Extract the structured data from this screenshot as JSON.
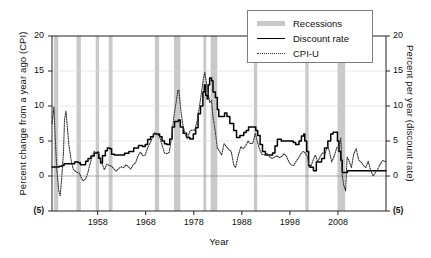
{
  "chart_data": {
    "type": "line",
    "title": "",
    "xlabel": "Year",
    "ylabel_left": "Percent change from a year ago (CPI)",
    "ylabel_right": "Percent per year (discount rate)",
    "xlim": [
      1948.5,
      2018
    ],
    "ylim": [
      -5,
      20
    ],
    "grid": true,
    "grid_values": [
      0,
      5,
      10,
      15,
      20
    ],
    "legend_position": "top-right",
    "xticks": [
      1958,
      1968,
      1978,
      1988,
      1998,
      2008
    ],
    "xtick_labels": [
      "1958",
      "1968",
      "1978",
      "1988",
      "1998",
      "2008"
    ],
    "yticks": [
      -5,
      0,
      5,
      10,
      15,
      20
    ],
    "ytick_labels": [
      "(5)",
      "0",
      "5",
      "10",
      "15",
      "20"
    ],
    "ytick_labels_right": [
      "(5)",
      "0",
      "5",
      "10",
      "15",
      "20"
    ],
    "legend": [
      {
        "name": "Recessions",
        "style": "band",
        "color": "#c8c8c8"
      },
      {
        "name": "Discount rate",
        "style": "solid",
        "color": "#000000"
      },
      {
        "name": "CPI-U",
        "style": "dotted",
        "color": "#333333"
      }
    ],
    "series": [
      {
        "name": "Discount rate",
        "style": "solid",
        "color": "#000000",
        "points": [
          [
            1948.5,
            1.3
          ],
          [
            1950.0,
            1.4
          ],
          [
            1950.6,
            1.5
          ],
          [
            1951.0,
            1.75
          ],
          [
            1952.5,
            1.75
          ],
          [
            1953.2,
            2.0
          ],
          [
            1954.0,
            1.9
          ],
          [
            1954.4,
            1.6
          ],
          [
            1955.0,
            1.6
          ],
          [
            1955.5,
            2.1
          ],
          [
            1956.0,
            2.5
          ],
          [
            1956.6,
            2.85
          ],
          [
            1957.3,
            3.3
          ],
          [
            1957.9,
            3.4
          ],
          [
            1958.2,
            2.55
          ],
          [
            1958.6,
            1.85
          ],
          [
            1959.0,
            2.9
          ],
          [
            1959.6,
            3.6
          ],
          [
            1960.0,
            4.0
          ],
          [
            1960.5,
            3.9
          ],
          [
            1960.9,
            3.1
          ],
          [
            1961.5,
            3.0
          ],
          [
            1963.0,
            3.0
          ],
          [
            1963.6,
            3.25
          ],
          [
            1964.5,
            3.5
          ],
          [
            1965.5,
            4.0
          ],
          [
            1966.5,
            4.35
          ],
          [
            1967.3,
            4.2
          ],
          [
            1967.9,
            4.5
          ],
          [
            1968.4,
            5.2
          ],
          [
            1969.0,
            5.6
          ],
          [
            1969.6,
            6.0
          ],
          [
            1970.3,
            6.0
          ],
          [
            1970.9,
            5.6
          ],
          [
            1971.4,
            5.0
          ],
          [
            1971.9,
            4.6
          ],
          [
            1972.4,
            4.5
          ],
          [
            1973.0,
            5.3
          ],
          [
            1973.5,
            7.0
          ],
          [
            1974.0,
            7.8
          ],
          [
            1974.8,
            8.0
          ],
          [
            1975.2,
            7.0
          ],
          [
            1975.8,
            6.1
          ],
          [
            1976.5,
            5.5
          ],
          [
            1977.2,
            5.3
          ],
          [
            1977.9,
            6.0
          ],
          [
            1978.4,
            6.9
          ],
          [
            1978.9,
            8.9
          ],
          [
            1979.4,
            10.0
          ],
          [
            1979.9,
            12.0
          ],
          [
            1980.2,
            13.0
          ],
          [
            1980.5,
            11.5
          ],
          [
            1980.8,
            11.0
          ],
          [
            1981.0,
            13.0
          ],
          [
            1981.3,
            14.0
          ],
          [
            1981.7,
            13.6
          ],
          [
            1982.0,
            12.0
          ],
          [
            1982.5,
            11.2
          ],
          [
            1982.9,
            9.5
          ],
          [
            1983.2,
            8.5
          ],
          [
            1983.8,
            8.5
          ],
          [
            1984.4,
            9.0
          ],
          [
            1984.9,
            8.5
          ],
          [
            1985.5,
            7.5
          ],
          [
            1986.3,
            6.5
          ],
          [
            1986.9,
            5.5
          ],
          [
            1987.6,
            5.8
          ],
          [
            1988.4,
            6.2
          ],
          [
            1988.9,
            6.5
          ],
          [
            1989.4,
            7.0
          ],
          [
            1990.4,
            7.0
          ],
          [
            1990.9,
            6.5
          ],
          [
            1991.3,
            5.8
          ],
          [
            1991.8,
            4.5
          ],
          [
            1992.3,
            3.5
          ],
          [
            1992.9,
            3.0
          ],
          [
            1993.9,
            3.0
          ],
          [
            1994.4,
            3.3
          ],
          [
            1994.9,
            4.3
          ],
          [
            1995.4,
            5.25
          ],
          [
            1996.2,
            5.0
          ],
          [
            1997.5,
            5.0
          ],
          [
            1998.7,
            4.8
          ],
          [
            1999.2,
            4.5
          ],
          [
            1999.9,
            5.0
          ],
          [
            2000.4,
            5.7
          ],
          [
            2000.9,
            6.0
          ],
          [
            2001.1,
            5.0
          ],
          [
            2001.5,
            3.5
          ],
          [
            2001.9,
            1.5
          ],
          [
            2002.3,
            1.25
          ],
          [
            2002.9,
            0.75
          ],
          [
            2003.5,
            2.0
          ],
          [
            2004.0,
            2.0
          ],
          [
            2004.6,
            2.5
          ],
          [
            2005.2,
            4.0
          ],
          [
            2005.9,
            5.0
          ],
          [
            2006.5,
            6.0
          ],
          [
            2007.0,
            6.25
          ],
          [
            2007.5,
            6.25
          ],
          [
            2007.9,
            5.0
          ],
          [
            2008.2,
            3.5
          ],
          [
            2008.6,
            2.25
          ],
          [
            2008.9,
            0.5
          ],
          [
            2010.0,
            0.75
          ],
          [
            2012.0,
            0.75
          ],
          [
            2015.0,
            0.75
          ],
          [
            2018.0,
            0.75
          ]
        ]
      },
      {
        "name": "CPI-U",
        "style": "dotted",
        "color": "#333333",
        "points": [
          [
            1948.5,
            7.5
          ],
          [
            1948.9,
            9.9
          ],
          [
            1949.2,
            5.0
          ],
          [
            1949.5,
            1.0
          ],
          [
            1949.9,
            -2.1
          ],
          [
            1950.2,
            -2.8
          ],
          [
            1950.5,
            -0.5
          ],
          [
            1950.9,
            3.5
          ],
          [
            1951.1,
            8.0
          ],
          [
            1951.4,
            9.3
          ],
          [
            1951.7,
            7.0
          ],
          [
            1952.0,
            4.5
          ],
          [
            1952.5,
            2.2
          ],
          [
            1952.9,
            1.0
          ],
          [
            1953.3,
            0.7
          ],
          [
            1953.8,
            0.5
          ],
          [
            1954.2,
            0.4
          ],
          [
            1954.7,
            -0.4
          ],
          [
            1955.0,
            -0.7
          ],
          [
            1955.5,
            -0.4
          ],
          [
            1955.9,
            0.3
          ],
          [
            1956.4,
            1.7
          ],
          [
            1956.9,
            2.9
          ],
          [
            1957.3,
            3.5
          ],
          [
            1957.8,
            3.2
          ],
          [
            1958.2,
            3.3
          ],
          [
            1958.6,
            2.2
          ],
          [
            1958.9,
            1.8
          ],
          [
            1959.4,
            0.9
          ],
          [
            1959.9,
            1.7
          ],
          [
            1960.4,
            1.5
          ],
          [
            1960.9,
            1.4
          ],
          [
            1961.4,
            1.0
          ],
          [
            1961.9,
            0.7
          ],
          [
            1962.4,
            1.1
          ],
          [
            1962.9,
            1.3
          ],
          [
            1963.4,
            1.2
          ],
          [
            1963.9,
            1.6
          ],
          [
            1964.4,
            1.3
          ],
          [
            1964.9,
            1.0
          ],
          [
            1965.4,
            1.6
          ],
          [
            1965.9,
            1.9
          ],
          [
            1966.4,
            2.9
          ],
          [
            1966.9,
            3.4
          ],
          [
            1967.4,
            2.9
          ],
          [
            1967.9,
            3.0
          ],
          [
            1968.4,
            4.0
          ],
          [
            1968.9,
            4.7
          ],
          [
            1969.4,
            5.5
          ],
          [
            1969.9,
            6.2
          ],
          [
            1970.4,
            6.0
          ],
          [
            1970.9,
            5.6
          ],
          [
            1971.4,
            4.4
          ],
          [
            1971.9,
            3.3
          ],
          [
            1972.4,
            3.2
          ],
          [
            1972.9,
            3.4
          ],
          [
            1973.4,
            5.5
          ],
          [
            1973.9,
            8.7
          ],
          [
            1974.3,
            10.4
          ],
          [
            1974.7,
            12.2
          ],
          [
            1974.9,
            12.3
          ],
          [
            1975.3,
            9.5
          ],
          [
            1975.7,
            7.4
          ],
          [
            1976.2,
            6.0
          ],
          [
            1976.7,
            5.4
          ],
          [
            1977.2,
            6.4
          ],
          [
            1977.7,
            6.6
          ],
          [
            1978.2,
            6.5
          ],
          [
            1978.7,
            7.9
          ],
          [
            1979.2,
            10.0
          ],
          [
            1979.6,
            11.9
          ],
          [
            1980.0,
            13.9
          ],
          [
            1980.3,
            14.8
          ],
          [
            1980.6,
            13.5
          ],
          [
            1980.9,
            12.5
          ],
          [
            1981.3,
            10.5
          ],
          [
            1981.7,
            10.8
          ],
          [
            1982.0,
            8.4
          ],
          [
            1982.4,
            6.8
          ],
          [
            1982.9,
            4.0
          ],
          [
            1983.3,
            3.6
          ],
          [
            1983.8,
            3.0
          ],
          [
            1984.3,
            4.6
          ],
          [
            1984.8,
            4.2
          ],
          [
            1985.3,
            3.8
          ],
          [
            1985.8,
            3.5
          ],
          [
            1986.3,
            1.6
          ],
          [
            1986.7,
            1.2
          ],
          [
            1987.2,
            2.8
          ],
          [
            1987.8,
            4.2
          ],
          [
            1988.3,
            3.9
          ],
          [
            1988.8,
            4.3
          ],
          [
            1989.3,
            5.0
          ],
          [
            1989.8,
            4.6
          ],
          [
            1990.3,
            4.7
          ],
          [
            1990.8,
            6.1
          ],
          [
            1991.2,
            5.0
          ],
          [
            1991.7,
            3.8
          ],
          [
            1992.2,
            3.1
          ],
          [
            1992.8,
            3.0
          ],
          [
            1993.3,
            3.2
          ],
          [
            1993.8,
            2.7
          ],
          [
            1994.3,
            2.5
          ],
          [
            1994.8,
            2.7
          ],
          [
            1995.3,
            2.9
          ],
          [
            1995.8,
            2.6
          ],
          [
            1996.3,
            2.8
          ],
          [
            1996.8,
            3.2
          ],
          [
            1997.3,
            2.8
          ],
          [
            1997.8,
            2.0
          ],
          [
            1998.3,
            1.6
          ],
          [
            1998.8,
            1.5
          ],
          [
            1999.3,
            2.1
          ],
          [
            1999.8,
            2.6
          ],
          [
            2000.3,
            3.2
          ],
          [
            2000.8,
            3.5
          ],
          [
            2001.2,
            3.3
          ],
          [
            2001.7,
            2.7
          ],
          [
            2002.0,
            1.2
          ],
          [
            2002.5,
            1.6
          ],
          [
            2002.9,
            2.4
          ],
          [
            2003.3,
            3.0
          ],
          [
            2003.8,
            2.0
          ],
          [
            2004.3,
            2.8
          ],
          [
            2004.8,
            3.3
          ],
          [
            2005.3,
            3.1
          ],
          [
            2005.8,
            4.3
          ],
          [
            2006.2,
            3.6
          ],
          [
            2006.7,
            2.0
          ],
          [
            2007.2,
            2.8
          ],
          [
            2007.8,
            4.1
          ],
          [
            2008.2,
            4.0
          ],
          [
            2008.6,
            5.5
          ],
          [
            2008.9,
            0.1
          ],
          [
            2009.2,
            -1.3
          ],
          [
            2009.6,
            -2.1
          ],
          [
            2009.9,
            2.7
          ],
          [
            2010.3,
            2.2
          ],
          [
            2010.8,
            1.2
          ],
          [
            2011.3,
            3.2
          ],
          [
            2011.8,
            3.9
          ],
          [
            2012.3,
            2.3
          ],
          [
            2012.8,
            2.0
          ],
          [
            2013.3,
            1.5
          ],
          [
            2013.8,
            1.2
          ],
          [
            2014.3,
            2.1
          ],
          [
            2014.8,
            0.8
          ],
          [
            2015.3,
            0.0
          ],
          [
            2015.8,
            0.5
          ],
          [
            2016.3,
            1.0
          ],
          [
            2016.8,
            1.7
          ],
          [
            2017.3,
            2.2
          ],
          [
            2017.8,
            2.1
          ],
          [
            2018.0,
            2.0
          ]
        ]
      }
    ],
    "recession_bands": [
      {
        "start": 1948.9,
        "end": 1949.8
      },
      {
        "start": 1953.6,
        "end": 1954.5
      },
      {
        "start": 1957.6,
        "end": 1958.3
      },
      {
        "start": 1960.3,
        "end": 1961.1
      },
      {
        "start": 1969.9,
        "end": 1970.8
      },
      {
        "start": 1973.9,
        "end": 1975.2
      },
      {
        "start": 1980.0,
        "end": 1980.6
      },
      {
        "start": 1981.5,
        "end": 1982.9
      },
      {
        "start": 1990.5,
        "end": 1991.2
      },
      {
        "start": 2001.2,
        "end": 2001.9
      },
      {
        "start": 2007.9,
        "end": 2009.5
      }
    ]
  }
}
